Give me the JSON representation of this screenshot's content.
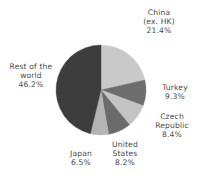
{
  "chart_data": {
    "type": "pie",
    "title": "",
    "subtitle": "",
    "xlabel": "",
    "ylabel": "",
    "legend_position": "none",
    "grid": false,
    "labels_inside": false,
    "units": "%",
    "categories": [
      "China (ex. HK)",
      "Turkey",
      "Czech Republic",
      "United States",
      "Japan",
      "Rest of the world"
    ],
    "values": [
      21.4,
      9.3,
      8.4,
      8.2,
      6.5,
      46.2
    ],
    "colors": [
      "#c9c9c9",
      "#6e6e6e",
      "#c4c4c4",
      "#6b6b6b",
      "#b4b4b4",
      "#3d3d3d"
    ],
    "start_angle_deg": 0,
    "direction": "clockwise",
    "slices": [
      {
        "name": "China (ex. HK)",
        "value": 21.4,
        "value_text": "21.4%",
        "color": "#c9c9c9",
        "label_lines": [
          "China",
          "(ex. HK)",
          "21.4%"
        ]
      },
      {
        "name": "Turkey",
        "value": 9.3,
        "value_text": "9.3%",
        "color": "#6e6e6e",
        "label_lines": [
          "Turkey",
          "9.3%"
        ]
      },
      {
        "name": "Czech Republic",
        "value": 8.4,
        "value_text": "8.4%",
        "color": "#c4c4c4",
        "label_lines": [
          "Czech",
          "Republic",
          "8.4%"
        ]
      },
      {
        "name": "United States",
        "value": 8.2,
        "value_text": "8.2%",
        "color": "#6b6b6b",
        "label_lines": [
          "United",
          "States",
          "8.2%"
        ]
      },
      {
        "name": "Japan",
        "value": 6.5,
        "value_text": "6.5%",
        "color": "#b4b4b4",
        "label_lines": [
          "Japan",
          "6.5%"
        ]
      },
      {
        "name": "Rest of the world",
        "value": 46.2,
        "value_text": "46.2%",
        "color": "#3d3d3d",
        "label_lines": [
          "Rest of the",
          "world",
          "46.2%"
        ]
      }
    ]
  },
  "labels": {
    "china": {
      "l1": "China",
      "l2": "(ex. HK)",
      "l3": "21.4%"
    },
    "turkey": {
      "l1": "Turkey",
      "l2": "9.3%"
    },
    "czech": {
      "l1": "Czech",
      "l2": "Republic",
      "l3": "8.4%"
    },
    "us": {
      "l1": "United",
      "l2": "States",
      "l3": "8.2%"
    },
    "japan": {
      "l1": "Japan",
      "l2": "6.5%"
    },
    "rest": {
      "l1": "Rest of the",
      "l2": "world",
      "l3": "46.2%"
    }
  },
  "geometry": {
    "center_x": 101,
    "center_y": 90,
    "radius": 45
  }
}
